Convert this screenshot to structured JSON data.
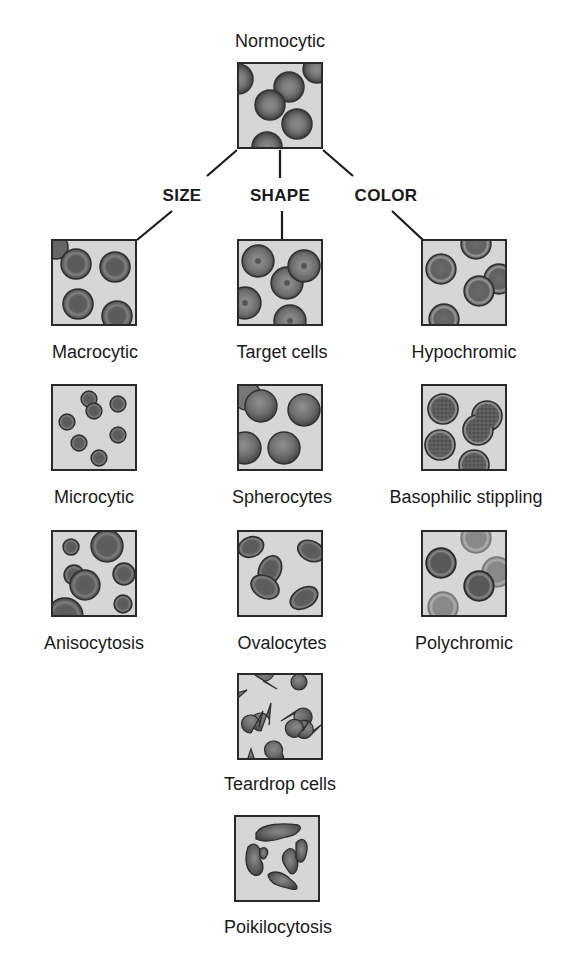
{
  "root": {
    "label": "Normocytic"
  },
  "categories": [
    {
      "label": "SIZE"
    },
    {
      "label": "SHAPE"
    },
    {
      "label": "COLOR"
    }
  ],
  "size": [
    {
      "label": "Macrocytic"
    },
    {
      "label": "Microcytic"
    },
    {
      "label": "Anisocytosis"
    }
  ],
  "shape": [
    {
      "label": "Target cells"
    },
    {
      "label": "Spherocytes"
    },
    {
      "label": "Ovalocytes"
    },
    {
      "label": "Teardrop cells"
    },
    {
      "label": "Poikilocytosis"
    }
  ],
  "color": [
    {
      "label": "Hypochromic"
    },
    {
      "label": "Basophilic stippling"
    },
    {
      "label": "Polychromic"
    }
  ],
  "colors": {
    "box_bg": "#d4d4d4",
    "box_border": "#2a2a2a",
    "cell_rim": "#3a3a3a",
    "cell_mid": "#6e6e6e",
    "cell_center": "#555555",
    "line": "#1a1a1a"
  }
}
